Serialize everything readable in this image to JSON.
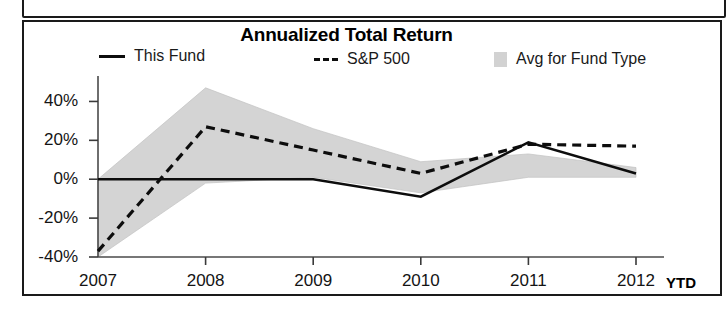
{
  "chart_data": {
    "type": "line",
    "title": "Annualized Total Return",
    "xlabel": "",
    "ylabel": "",
    "x": [
      "2007",
      "2008",
      "2009",
      "2010",
      "2011",
      "2012 YTD"
    ],
    "categories": [
      "2007",
      "2008",
      "2009",
      "2010",
      "2011",
      "2012"
    ],
    "ylim": [
      -40,
      50
    ],
    "yticks": [
      40,
      20,
      0,
      -20,
      -40
    ],
    "ytick_labels": [
      "40%",
      "20%",
      "0%",
      "-20%",
      "-40%"
    ],
    "grid": false,
    "legend_position": "top",
    "series": [
      {
        "name": "This Fund",
        "style": "solid",
        "color": "#0d0d0d",
        "values": [
          0,
          0,
          0,
          -9,
          19,
          3
        ]
      },
      {
        "name": "S&P 500",
        "style": "dashed",
        "color": "#0d0d0d",
        "values": [
          -37,
          27,
          15,
          3,
          18,
          17
        ]
      },
      {
        "name": "Avg for Fund Type",
        "style": "band",
        "color": "#d2d2d2",
        "upper": [
          0,
          47,
          26,
          9,
          13,
          6
        ],
        "lower": [
          -40,
          -2,
          1,
          -7,
          1,
          1
        ]
      }
    ],
    "annotations": [
      {
        "text": "YTD",
        "position": "x-axis-right",
        "bold": true
      }
    ]
  },
  "chart": {
    "title": "Annualized Total Return",
    "legend": [
      {
        "label": "This Fund",
        "swatch": "solid-line-swatch"
      },
      {
        "label": "S&P 500",
        "swatch": "dashed-line-swatch"
      },
      {
        "label": "Avg for Fund Type",
        "swatch": "shaded-band-swatch"
      }
    ],
    "y_axis": {
      "labels": [
        "40%",
        "20%",
        "0%",
        "-20%",
        "-40%"
      ]
    },
    "x_axis": {
      "labels": [
        "2007",
        "2008",
        "2009",
        "2010",
        "2011",
        "2012"
      ],
      "suffix": "YTD"
    }
  }
}
